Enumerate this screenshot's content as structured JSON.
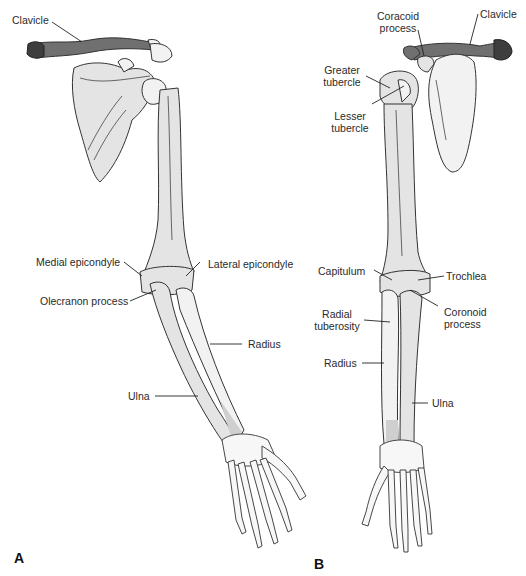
{
  "figure": {
    "panels": [
      {
        "id": "A",
        "label": "A",
        "view": "posterior view of right upper limb",
        "labels": {
          "clavicle": "Clavicle",
          "medial_epicondyle": "Medial epicondyle",
          "lateral_epicondyle": "Lateral epicondyle",
          "olecranon_process": "Olecranon process",
          "radius": "Radius",
          "ulna": "Ulna"
        }
      },
      {
        "id": "B",
        "label": "B",
        "view": "anterior view of right upper limb",
        "labels": {
          "coracoid_line1": "Coracoid",
          "coracoid_line2": "process",
          "clavicle": "Clavicle",
          "greater_line1": "Greater",
          "greater_line2": "tubercle",
          "lesser_line1": "Lesser",
          "lesser_line2": "tubercle",
          "capitulum": "Capitulum",
          "trochlea": "Trochlea",
          "radial_tub_line1": "Radial",
          "radial_tub_line2": "tuberosity",
          "coronoid_line1": "Coronoid",
          "coronoid_line2": "process",
          "radius": "Radius",
          "ulna": "Ulna"
        }
      }
    ],
    "colors": {
      "bone_fill": "#e4e4e4",
      "bone_outline": "#333333",
      "clavicle_fill": "#707070",
      "background": "#ffffff"
    }
  }
}
